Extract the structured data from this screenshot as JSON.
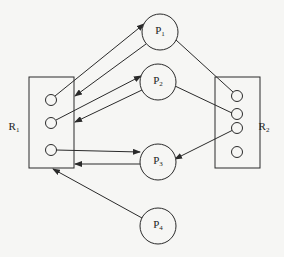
{
  "diagram": {
    "type": "resource-allocation-graph",
    "colors": {
      "stroke": "#2a2a2a",
      "background": "#f6f6f4"
    },
    "resources": [
      {
        "id": "R1",
        "label": "R",
        "sub": "1",
        "box": {
          "x": 29,
          "y": 77,
          "w": 45,
          "h": 91
        },
        "label_pos": {
          "x": 14,
          "y": 127
        },
        "instances": [
          {
            "cx": 51,
            "cy": 100
          },
          {
            "cx": 51,
            "cy": 123
          },
          {
            "cx": 51,
            "cy": 150
          }
        ]
      },
      {
        "id": "R2",
        "label": "R",
        "sub": "2",
        "box": {
          "x": 215,
          "y": 77,
          "w": 45,
          "h": 91
        },
        "label_pos": {
          "x": 264,
          "y": 127
        },
        "instances": [
          {
            "cx": 237,
            "cy": 96
          },
          {
            "cx": 237,
            "cy": 114
          },
          {
            "cx": 237,
            "cy": 128
          },
          {
            "cx": 237,
            "cy": 152
          }
        ]
      }
    ],
    "processes": [
      {
        "id": "P1",
        "label": "P",
        "sub": "1",
        "cx": 160,
        "cy": 32,
        "r": 18
      },
      {
        "id": "P2",
        "label": "P",
        "sub": "2",
        "cx": 158,
        "cy": 82,
        "r": 18
      },
      {
        "id": "P3",
        "label": "P",
        "sub": "3",
        "cx": 158,
        "cy": 162,
        "r": 18
      },
      {
        "id": "P4",
        "label": "P",
        "sub": "4",
        "cx": 158,
        "cy": 226,
        "r": 18
      }
    ],
    "edges": [
      {
        "from": "R1.0",
        "to": "P1",
        "x1": 55,
        "y1": 96,
        "x2": 144,
        "y2": 24,
        "arrow": true,
        "kind": "assignment"
      },
      {
        "from": "P1",
        "to": "R1",
        "x1": 146,
        "y1": 44,
        "x2": 75,
        "y2": 96,
        "arrow": true,
        "kind": "request"
      },
      {
        "from": "R1.1",
        "to": "P2",
        "x1": 56,
        "y1": 120,
        "x2": 141,
        "y2": 76,
        "arrow": true,
        "kind": "assignment"
      },
      {
        "from": "P2",
        "to": "R1",
        "x1": 142,
        "y1": 90,
        "x2": 75,
        "y2": 122,
        "arrow": true,
        "kind": "request"
      },
      {
        "from": "R1.2",
        "to": "P3",
        "x1": 56,
        "y1": 150,
        "x2": 140,
        "y2": 152,
        "arrow": true,
        "kind": "assignment"
      },
      {
        "from": "P3",
        "to": "R1",
        "x1": 140,
        "y1": 164,
        "x2": 75,
        "y2": 164,
        "arrow": true,
        "kind": "request"
      },
      {
        "from": "P4",
        "to": "R1",
        "x1": 142,
        "y1": 218,
        "x2": 53,
        "y2": 169,
        "arrow": true,
        "kind": "request"
      },
      {
        "from": "P1",
        "to": "R2.0",
        "x1": 176,
        "y1": 40,
        "x2": 233,
        "y2": 92,
        "arrow": false,
        "kind": "assignment"
      },
      {
        "from": "P2",
        "to": "R2.1",
        "x1": 175,
        "y1": 86,
        "x2": 232,
        "y2": 113,
        "arrow": false,
        "kind": "assignment"
      },
      {
        "from": "R2.2",
        "to": "P3",
        "x1": 233,
        "y1": 130,
        "x2": 175,
        "y2": 159,
        "arrow": true,
        "kind": "assignment"
      }
    ]
  }
}
